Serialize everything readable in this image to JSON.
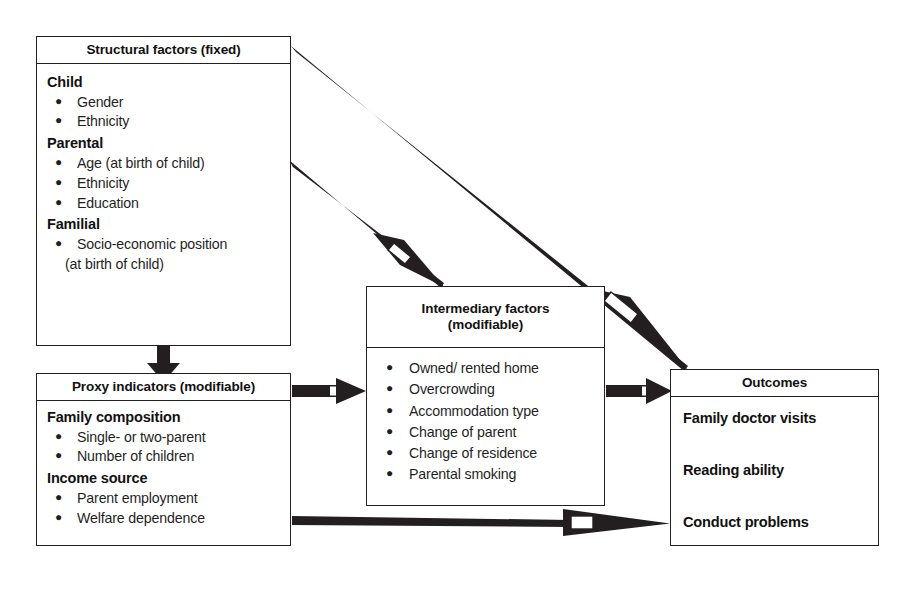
{
  "figure": {
    "line_color": "#231f20",
    "arrow_color": "#231f20",
    "background": "#ffffff"
  },
  "boxes": {
    "structural": {
      "header": "Structural factors (fixed)",
      "groups": [
        {
          "heading": "Child",
          "items": [
            "Gender",
            "Ethnicity"
          ]
        },
        {
          "heading": "Parental",
          "items": [
            "Age (at birth of child)",
            "Ethnicity",
            "Education"
          ]
        },
        {
          "heading": "Familial",
          "items": [
            "Socio-economic position"
          ],
          "continuation": "(at birth of child)"
        }
      ]
    },
    "proxy": {
      "header": "Proxy indicators (modifiable)",
      "groups": [
        {
          "heading": "Family composition",
          "items": [
            "Single- or two-parent",
            "Number of children"
          ]
        },
        {
          "heading": "Income source",
          "items": [
            "Parent employment",
            "Welfare dependence"
          ]
        }
      ]
    },
    "intermediary": {
      "header_line1": "Intermediary factors",
      "header_line2": "(modifiable)",
      "items": [
        "Owned/ rented home",
        "Overcrowding",
        "Accommodation type",
        "Change of parent",
        "Change of residence",
        "Parental smoking"
      ]
    },
    "outcomes": {
      "header": "Outcomes",
      "items": [
        "Family doctor visits",
        "Reading ability",
        "Conduct problems"
      ]
    }
  },
  "arrows": [
    {
      "name": "structural-to-proxy",
      "from": "structural",
      "to": "proxy",
      "style": "thick-vertical"
    },
    {
      "name": "proxy-to-intermediary",
      "from": "proxy",
      "to": "intermediary",
      "style": "thick-horizontal"
    },
    {
      "name": "intermediary-to-outcomes",
      "from": "intermediary",
      "to": "outcomes",
      "style": "thick-horizontal"
    },
    {
      "name": "structural-to-intermediary",
      "from": "structural",
      "to": "intermediary",
      "style": "tapered-diagonal"
    },
    {
      "name": "structural-to-outcomes",
      "from": "structural",
      "to": "outcomes",
      "style": "tapered-diagonal"
    },
    {
      "name": "proxy-to-outcomes",
      "from": "proxy",
      "to": "outcomes",
      "style": "tapered-horizontal"
    }
  ]
}
